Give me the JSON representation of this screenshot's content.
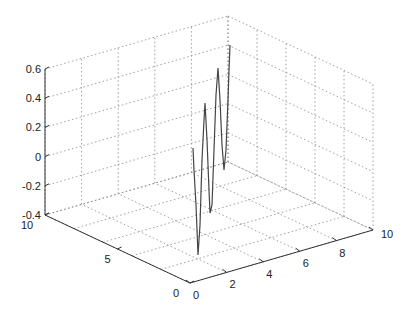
{
  "chart_data": {
    "type": "line",
    "projection": "3d",
    "title": "",
    "xlabel": "",
    "ylabel": "",
    "zlabel": "",
    "xlim": [
      0,
      10
    ],
    "ylim": [
      0,
      10
    ],
    "zlim": [
      -0.4,
      0.6
    ],
    "x_ticks": [
      "0",
      "2",
      "4",
      "6",
      "8",
      "10"
    ],
    "y_ticks": [
      "0",
      "5",
      "10"
    ],
    "z_ticks": [
      "-0.4",
      "-0.2",
      "0",
      "0.2",
      "0.4",
      "0.6"
    ],
    "grid": true,
    "legend": null,
    "series": [
      {
        "name": "trace",
        "color": "#444444",
        "description": "oscillating 3D curve near the x=0..2 corner rising toward back",
        "screen_points": [
          [
            193,
            148
          ],
          [
            194,
            170
          ],
          [
            196,
            205
          ],
          [
            197,
            230
          ],
          [
            198,
            255
          ],
          [
            200,
            225
          ],
          [
            202,
            160
          ],
          [
            204,
            120
          ],
          [
            205,
            103
          ],
          [
            207,
            140
          ],
          [
            209,
            190
          ],
          [
            210,
            213
          ],
          [
            212,
            205
          ],
          [
            214,
            150
          ],
          [
            216,
            95
          ],
          [
            218,
            68
          ],
          [
            220,
            100
          ],
          [
            222,
            145
          ],
          [
            224,
            170
          ],
          [
            226,
            150
          ],
          [
            228,
            100
          ],
          [
            229,
            70
          ],
          [
            230,
            45
          ]
        ]
      }
    ]
  },
  "axes": {
    "z_labels": [
      "0.6",
      "0.4",
      "0.2",
      "0",
      "-0.2",
      "-0.4"
    ],
    "y_labels": [
      "10",
      "5",
      "0"
    ],
    "x_labels": [
      "0",
      "2",
      "4",
      "6",
      "8",
      "10"
    ]
  }
}
